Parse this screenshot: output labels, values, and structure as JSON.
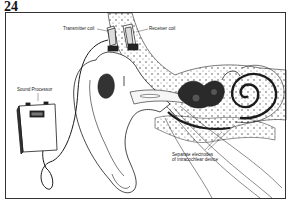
{
  "figure": {
    "number": "24",
    "labels": {
      "transmitter_coil": "Transmitter coil",
      "receiver_coil": "Receiver coil",
      "sound_processor": "Sound Processor",
      "electrodes_line1": "Separate electrodes",
      "electrodes_line2": "of intracochlear device"
    }
  },
  "colors": {
    "ink": "#1a1a1a",
    "paper": "#ffffff",
    "frame": "#333333",
    "bone_stipple": "#777777"
  }
}
